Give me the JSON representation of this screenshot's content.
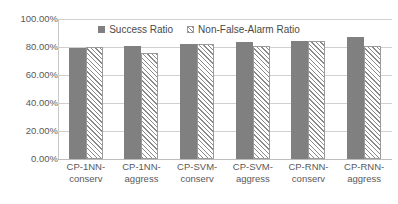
{
  "chart_data": {
    "type": "bar",
    "title": "",
    "xlabel": "",
    "ylabel": "",
    "categories": [
      "CP-1NN-conserv",
      "CP-1NN-aggress",
      "CP-SVM-conserv",
      "CP-SVM-aggress",
      "CP-RNN-conserv",
      "CP-RNN-aggress"
    ],
    "category_lines": [
      [
        "CP-1NN-",
        "conserv"
      ],
      [
        "CP-1NN-",
        "aggress"
      ],
      [
        "CP-SVM-",
        "conserv"
      ],
      [
        "CP-SVM-",
        "aggress"
      ],
      [
        "CP-RNN-",
        "conserv"
      ],
      [
        "CP-RNN-",
        "aggress"
      ]
    ],
    "series": [
      {
        "name": "Success Ratio",
        "pattern": "solid",
        "color": "#808080",
        "values": [
          79.5,
          81.0,
          82.0,
          83.5,
          84.0,
          87.5
        ]
      },
      {
        "name": "Non-False-Alarm Ratio",
        "pattern": "diagonal-hatch",
        "color": "#8a8a8a",
        "values": [
          80.0,
          76.0,
          82.0,
          81.0,
          84.0,
          81.0
        ]
      }
    ],
    "ylim": [
      0,
      100
    ],
    "yticks": [
      0,
      20,
      40,
      60,
      80,
      100
    ],
    "ytick_labels": [
      "0.00%",
      "20.00%",
      "40.00%",
      "60.00%",
      "80.00%",
      "100.00%"
    ],
    "grid": true,
    "legend_position": "top-center",
    "value_suffix": "%"
  },
  "legend": {
    "items": [
      {
        "label": "Success Ratio"
      },
      {
        "label": "Non-False-Alarm Ratio"
      }
    ]
  }
}
